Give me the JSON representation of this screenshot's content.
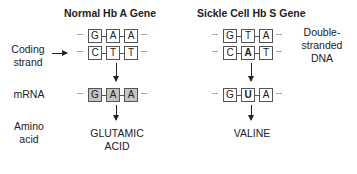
{
  "titles": {
    "normal": "Normal Hb A Gene",
    "sickle": "Sickle Cell Hb S Gene"
  },
  "row_labels": {
    "coding_strand_1": "Coding",
    "coding_strand_2": "strand",
    "mrna": "mRNA",
    "amino_1": "Amino",
    "amino_2": "acid",
    "dna_1": "Double-",
    "dna_2": "stranded",
    "dna_3": "DNA"
  },
  "normal": {
    "template_strand": [
      "G",
      "A",
      "A"
    ],
    "coding_strand": [
      "C",
      "T",
      "T"
    ],
    "mrna": [
      "G",
      "A",
      "A"
    ],
    "amino_acid_1": "GLUTAMIC",
    "amino_acid_2": "ACID"
  },
  "sickle": {
    "template_strand": [
      "G",
      "T",
      "A"
    ],
    "coding_strand": [
      "C",
      "A",
      "T"
    ],
    "mrna": [
      "G",
      "U",
      "A"
    ],
    "amino_acid": "VALINE"
  },
  "dashes": "--"
}
